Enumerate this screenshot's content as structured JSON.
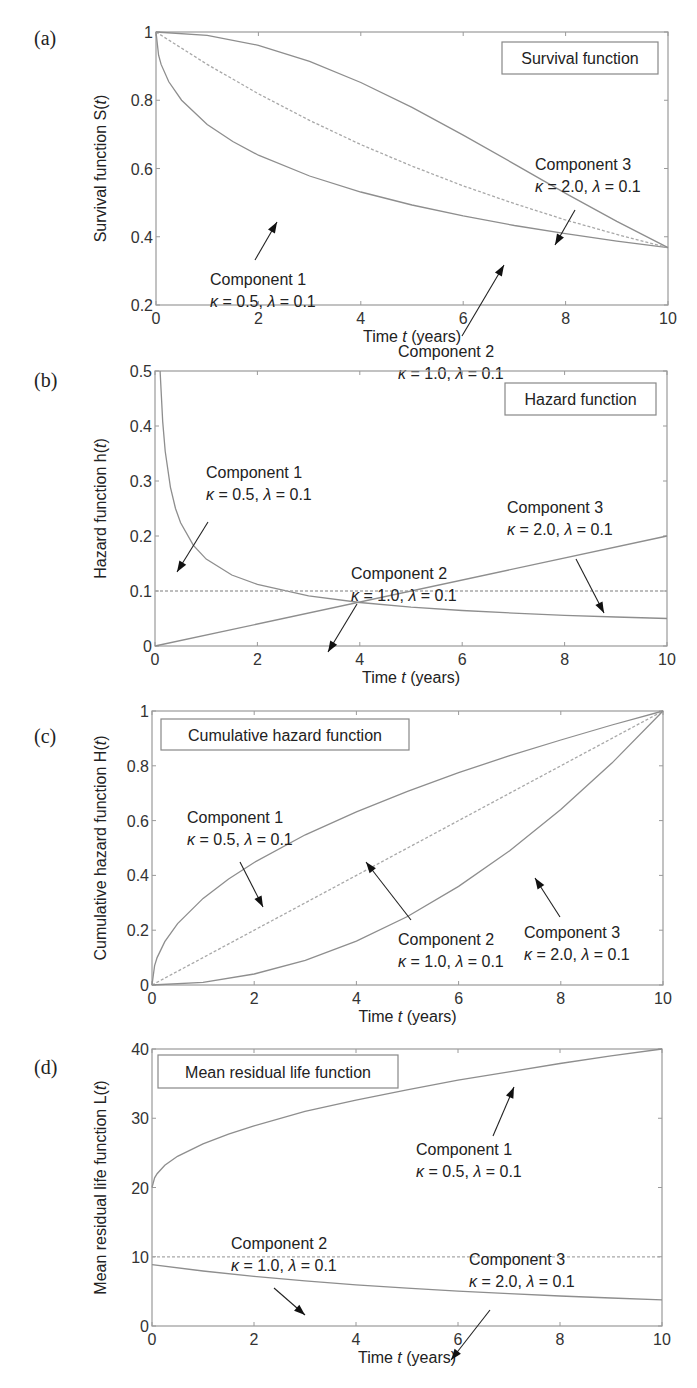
{
  "chart_data": [
    {
      "id": "a",
      "type": "line",
      "panel_label": "(a)",
      "title": "Survival function",
      "xlabel": "Time t (years)",
      "ylabel": "Survival function S(t)",
      "xlim": [
        0,
        10
      ],
      "ylim": [
        0.2,
        1
      ],
      "xticks": [
        "0",
        "2",
        "4",
        "6",
        "8",
        "10"
      ],
      "yticks": [
        "0.2",
        "0.4",
        "0.6",
        "0.8",
        "1"
      ],
      "ytick_values": [
        0.2,
        0.4,
        0.6,
        0.8,
        1
      ],
      "grid": false,
      "legend_position": "top-right",
      "frame": {
        "left": 156,
        "top": 32,
        "right": 668,
        "bottom": 305
      },
      "legend_box": {
        "x": 502,
        "y": 42,
        "w": 156,
        "h": 32
      },
      "series": [
        {
          "name": "Component 1",
          "params": "κ = 0.5, λ = 0.1",
          "style": "solid",
          "x": [
            0,
            0.05,
            0.1,
            0.25,
            0.5,
            1,
            1.5,
            2,
            3,
            4,
            5,
            6,
            7,
            8,
            9,
            10
          ],
          "y": [
            1,
            0.932,
            0.905,
            0.854,
            0.8,
            0.729,
            0.679,
            0.639,
            0.578,
            0.531,
            0.493,
            0.461,
            0.433,
            0.409,
            0.387,
            0.368
          ]
        },
        {
          "name": "Component 2",
          "params": "κ = 1.0, λ = 0.1",
          "style": "dashed",
          "x": [
            0,
            1,
            2,
            3,
            4,
            5,
            6,
            7,
            8,
            9,
            10
          ],
          "y": [
            1,
            0.905,
            0.819,
            0.741,
            0.67,
            0.607,
            0.549,
            0.497,
            0.449,
            0.407,
            0.368
          ]
        },
        {
          "name": "Component 3",
          "params": "κ = 2.0, λ = 0.1",
          "style": "solid",
          "x": [
            0,
            1,
            2,
            3,
            4,
            5,
            6,
            7,
            8,
            9,
            10
          ],
          "y": [
            1,
            0.99,
            0.961,
            0.914,
            0.852,
            0.779,
            0.698,
            0.613,
            0.527,
            0.445,
            0.368
          ]
        }
      ],
      "annotations": [
        {
          "line1": "Component 1",
          "line2": "κ = 0.5, λ = 0.1",
          "text_x": 210,
          "text_y": 285,
          "arrow_from": [
            255,
            260
          ],
          "arrow_to": [
            277,
            222
          ]
        },
        {
          "line1": "Component 2",
          "line2": "κ = 1.0, λ = 0.1",
          "text_x": 398,
          "text_y": 357,
          "arrow_from": [
            462,
            336
          ],
          "arrow_to": [
            504,
            265
          ]
        },
        {
          "line1": "Component 3",
          "line2": "κ = 2.0, λ = 0.1",
          "text_x": 535,
          "text_y": 170,
          "arrow_from": [
            575,
            210
          ],
          "arrow_to": [
            555,
            245
          ]
        }
      ]
    },
    {
      "id": "b",
      "type": "line",
      "panel_label": "(b)",
      "title": "Hazard function",
      "xlabel": "Time t (years)",
      "ylabel": "Hazard function h(t)",
      "xlim": [
        0,
        10
      ],
      "ylim": [
        0,
        0.5
      ],
      "xticks": [
        "0",
        "2",
        "4",
        "6",
        "8",
        "10"
      ],
      "yticks": [
        "0",
        "0.1",
        "0.2",
        "0.3",
        "0.4",
        "0.5"
      ],
      "ytick_values": [
        0,
        0.1,
        0.2,
        0.3,
        0.4,
        0.5
      ],
      "grid": false,
      "legend_position": "top-right",
      "frame": {
        "left": 155,
        "top": 371,
        "right": 667,
        "bottom": 646
      },
      "legend_box": {
        "x": 505,
        "y": 383,
        "w": 151,
        "h": 32
      },
      "series": [
        {
          "name": "Component 1",
          "params": "κ = 0.5, λ = 0.1",
          "style": "solid",
          "x": [
            0.1,
            0.15,
            0.2,
            0.3,
            0.4,
            0.5,
            0.75,
            1,
            1.5,
            2,
            3,
            4,
            5,
            6,
            7,
            8,
            9,
            10
          ],
          "y": [
            0.5,
            0.408,
            0.354,
            0.289,
            0.25,
            0.224,
            0.183,
            0.158,
            0.129,
            0.112,
            0.0913,
            0.079,
            0.0707,
            0.0645,
            0.0598,
            0.0559,
            0.0527,
            0.05
          ]
        },
        {
          "name": "Component 2",
          "params": "κ = 1.0, λ = 0.1",
          "style": "dashed",
          "x": [
            0,
            10
          ],
          "y": [
            0.1,
            0.1
          ]
        },
        {
          "name": "Component 3",
          "params": "κ = 2.0, λ = 0.1",
          "style": "solid",
          "x": [
            0,
            10
          ],
          "y": [
            0,
            0.2
          ]
        }
      ],
      "annotations": [
        {
          "line1": "Component 1",
          "line2": "κ = 0.5, λ = 0.1",
          "text_x": 206,
          "text_y": 478,
          "arrow_from": [
            208,
            522
          ],
          "arrow_to": [
            177,
            572
          ]
        },
        {
          "line1": "Component 2",
          "line2": "κ = 1.0, λ = 0.1",
          "text_x": 351,
          "text_y": 579,
          "arrow_from": [
            357,
            604
          ],
          "arrow_to": [
            328,
            652
          ]
        },
        {
          "line1": "Component 3",
          "line2": "κ = 2.0, λ = 0.1",
          "text_x": 507,
          "text_y": 513,
          "arrow_from": [
            576,
            559
          ],
          "arrow_to": [
            604,
            613
          ]
        }
      ]
    },
    {
      "id": "c",
      "type": "line",
      "panel_label": "(c)",
      "title": "Cumulative hazard function",
      "xlabel": "Time t (years)",
      "ylabel": "Cumulative hazard function H(t)",
      "xlim": [
        0,
        10
      ],
      "ylim": [
        0,
        1
      ],
      "xticks": [
        "0",
        "2",
        "4",
        "6",
        "8",
        "10"
      ],
      "yticks": [
        "0",
        "0.2",
        "0.4",
        "0.6",
        "0.8",
        "1"
      ],
      "ytick_values": [
        0,
        0.2,
        0.4,
        0.6,
        0.8,
        1
      ],
      "grid": false,
      "legend_position": "top-left",
      "frame": {
        "left": 152,
        "top": 711,
        "right": 663,
        "bottom": 985
      },
      "legend_box": {
        "x": 161,
        "y": 719,
        "w": 248,
        "h": 31
      },
      "series": [
        {
          "name": "Component 1",
          "params": "κ = 0.5, λ = 0.1",
          "style": "solid",
          "x": [
            0,
            0.05,
            0.1,
            0.25,
            0.5,
            1,
            1.5,
            2,
            3,
            4,
            5,
            6,
            7,
            8,
            9,
            10
          ],
          "y": [
            0,
            0.0707,
            0.1,
            0.158,
            0.224,
            0.316,
            0.387,
            0.447,
            0.548,
            0.632,
            0.707,
            0.775,
            0.837,
            0.894,
            0.949,
            1
          ]
        },
        {
          "name": "Component 2",
          "params": "κ = 1.0, λ = 0.1",
          "style": "dashed",
          "x": [
            0,
            10
          ],
          "y": [
            0,
            1
          ]
        },
        {
          "name": "Component 3",
          "params": "κ = 2.0, λ = 0.1",
          "style": "solid",
          "x": [
            0,
            1,
            2,
            3,
            4,
            5,
            6,
            7,
            8,
            9,
            10
          ],
          "y": [
            0,
            0.01,
            0.04,
            0.09,
            0.16,
            0.25,
            0.36,
            0.49,
            0.64,
            0.81,
            1
          ]
        }
      ],
      "annotations": [
        {
          "line1": "Component 1",
          "line2": "κ = 0.5, λ = 0.1",
          "text_x": 187,
          "text_y": 823,
          "arrow_from": [
            240,
            862
          ],
          "arrow_to": [
            263,
            907
          ]
        },
        {
          "line1": "Component 2",
          "line2": "κ = 1.0, λ = 0.1",
          "text_x": 398,
          "text_y": 945,
          "arrow_from": [
            411,
            920
          ],
          "arrow_to": [
            366,
            862
          ]
        },
        {
          "line1": "Component 3",
          "line2": "κ = 2.0, λ = 0.1",
          "text_x": 524,
          "text_y": 938,
          "arrow_from": [
            560,
            917
          ],
          "arrow_to": [
            535,
            878
          ]
        }
      ]
    },
    {
      "id": "d",
      "type": "line",
      "panel_label": "(d)",
      "title": "Mean residual life function",
      "xlabel": "Time t (years)",
      "ylabel": "Mean residual life function L(t)",
      "xlim": [
        0,
        10
      ],
      "ylim": [
        0,
        40
      ],
      "xticks": [
        "0",
        "2",
        "4",
        "6",
        "8",
        "10"
      ],
      "yticks": [
        "0",
        "10",
        "20",
        "30",
        "40"
      ],
      "ytick_values": [
        0,
        10,
        20,
        30,
        40
      ],
      "grid": false,
      "legend_position": "top-left",
      "frame": {
        "left": 152,
        "top": 1049,
        "right": 662,
        "bottom": 1326
      },
      "legend_box": {
        "x": 158,
        "y": 1055,
        "w": 240,
        "h": 33
      },
      "series": [
        {
          "name": "Component 1",
          "params": "κ = 0.5, λ = 0.1",
          "style": "solid",
          "x": [
            0,
            0.05,
            0.1,
            0.25,
            0.5,
            1,
            1.5,
            2,
            3,
            4,
            5,
            6,
            7,
            8,
            9,
            10
          ],
          "y": [
            20,
            21.4,
            22.0,
            23.2,
            24.5,
            26.3,
            27.7,
            28.9,
            31.0,
            32.6,
            34.1,
            35.5,
            36.7,
            37.9,
            39.0,
            40
          ]
        },
        {
          "name": "Component 2",
          "params": "κ = 1.0, λ = 0.1",
          "style": "dashed",
          "x": [
            0,
            10
          ],
          "y": [
            10,
            10
          ]
        },
        {
          "name": "Component 3",
          "params": "κ = 2.0, λ = 0.1",
          "style": "solid",
          "x": [
            0,
            1,
            2,
            3,
            4,
            5,
            6,
            7,
            8,
            9,
            10
          ],
          "y": [
            8.86,
            7.94,
            7.17,
            6.51,
            5.94,
            5.46,
            5.03,
            4.66,
            4.33,
            4.05,
            3.79
          ]
        }
      ],
      "annotations": [
        {
          "line1": "Component 1",
          "line2": "κ = 0.5, λ = 0.1",
          "text_x": 416,
          "text_y": 1155,
          "arrow_from": [
            493,
            1136
          ],
          "arrow_to": [
            514,
            1087
          ]
        },
        {
          "line1": "Component 2",
          "line2": "κ = 1.0, λ = 0.1",
          "text_x": 231,
          "text_y": 1249,
          "arrow_from": [
            274,
            1288
          ],
          "arrow_to": [
            305,
            1315
          ]
        },
        {
          "line1": "Component 3",
          "line2": "κ = 2.0, λ = 0.1",
          "text_x": 469,
          "text_y": 1265,
          "arrow_from": [
            490,
            1310
          ],
          "arrow_to": [
            451,
            1360
          ]
        }
      ]
    }
  ]
}
